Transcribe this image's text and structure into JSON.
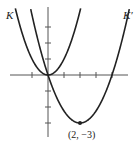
{
  "chart_data": {
    "type": "line",
    "title": "",
    "xlabel": "",
    "ylabel": "",
    "xlim": [
      -2.4,
      5
    ],
    "ylim": [
      -3.9,
      4.3
    ],
    "grid": false,
    "legend": "inline labels",
    "x_ticks": [
      -1,
      0,
      1,
      2,
      3,
      4
    ],
    "y_ticks": [
      -3,
      -2,
      -1,
      0,
      1,
      2,
      3
    ],
    "series": [
      {
        "name": "K",
        "equation": "y = x^2",
        "vertex": [
          0,
          0
        ]
      },
      {
        "name": "K'",
        "equation": "y = 0.75(x - 2)^2 - 3",
        "vertex": [
          2,
          -3
        ]
      }
    ],
    "annotations": [
      {
        "text": "(2, −3)",
        "x": 2,
        "y": -3,
        "marked_point": true
      }
    ]
  },
  "labels": {
    "k": "K",
    "k_prime": "K′",
    "vertex": "(2, −3)"
  },
  "colors": {
    "curve": "#222222",
    "axis": "#555555"
  }
}
